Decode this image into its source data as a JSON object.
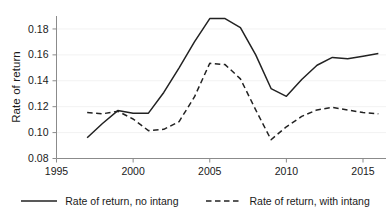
{
  "chart_data": {
    "type": "line",
    "title": "",
    "xlabel": "",
    "ylabel": "Rate of return",
    "xlim": [
      1995,
      2016.5
    ],
    "ylim": [
      0.08,
      0.19
    ],
    "grid": "horizontal-faint",
    "legend_position": "bottom-center",
    "xticks": [
      1995,
      2000,
      2005,
      2010,
      2015
    ],
    "xtick_labels": [
      "1995",
      "2000",
      "2005",
      "2010",
      "2015"
    ],
    "yticks": [
      0.08,
      0.1,
      0.12,
      0.14,
      0.16,
      0.18
    ],
    "ytick_labels": [
      "0.08",
      "0.10",
      "0.12",
      "0.14",
      "0.16",
      "0.18"
    ],
    "x": [
      1997,
      1998,
      1999,
      2000,
      2001,
      2002,
      2003,
      2004,
      2005,
      2006,
      2007,
      2008,
      2009,
      2010,
      2011,
      2012,
      2013,
      2014,
      2015,
      2016
    ],
    "series": [
      {
        "name": "Rate of return, no intang",
        "style": "solid",
        "color": "#222222",
        "values": [
          0.096,
          0.107,
          0.117,
          0.115,
          0.115,
          0.131,
          0.15,
          0.17,
          0.188,
          0.188,
          0.181,
          0.16,
          0.134,
          0.128,
          0.141,
          0.152,
          0.158,
          0.157,
          0.159,
          0.161
        ]
      },
      {
        "name": "Rate of return, with intang",
        "style": "dashed",
        "color": "#222222",
        "values": [
          0.1155,
          0.1145,
          0.1165,
          0.1105,
          0.1015,
          0.1025,
          0.1085,
          0.1275,
          0.1535,
          0.1525,
          0.1415,
          0.1175,
          0.0945,
          0.1045,
          0.1125,
          0.1175,
          0.1195,
          0.1175,
          0.1155,
          0.1145
        ]
      }
    ]
  },
  "legend": {
    "items": [
      {
        "label": "Rate of return, no intang",
        "style": "solid"
      },
      {
        "label": "Rate of return, with intang",
        "style": "dashed"
      }
    ]
  }
}
